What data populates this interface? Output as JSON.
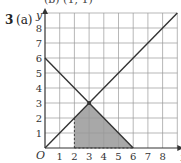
{
  "header": {
    "previous_answer": "(b) (1, 1)",
    "question_number": "3",
    "question_part": "(a)"
  },
  "chart_data": {
    "type": "line",
    "title": "",
    "xlabel": "x",
    "ylabel": "y",
    "origin_label": "O",
    "xlim": [
      0,
      9
    ],
    "ylim": [
      0,
      9
    ],
    "x_ticks": [
      "1",
      "2",
      "3",
      "4",
      "5",
      "6",
      "7",
      "8"
    ],
    "y_ticks": [
      "1",
      "2",
      "3",
      "4",
      "5",
      "6",
      "7",
      "8"
    ],
    "grid": true,
    "series": [
      {
        "name": "y = x",
        "points": [
          [
            0,
            0
          ],
          [
            9,
            9
          ]
        ]
      },
      {
        "name": "y = 6 - x",
        "points": [
          [
            0,
            6
          ],
          [
            6,
            0
          ]
        ]
      }
    ],
    "shaded_region": {
      "vertices": [
        [
          2,
          0
        ],
        [
          2,
          2
        ],
        [
          3,
          3
        ],
        [
          6,
          0
        ]
      ],
      "color": "#a8a8a8"
    },
    "dashed_lines": [
      [
        [
          2,
          0
        ],
        [
          2,
          2
        ]
      ],
      [
        [
          2,
          0
        ],
        [
          6,
          0
        ]
      ]
    ],
    "marked_points": [
      [
        3,
        3
      ]
    ]
  },
  "colors": {
    "grid": "#9a9a9a",
    "line": "#333333",
    "shade": "#a8a8a8"
  }
}
